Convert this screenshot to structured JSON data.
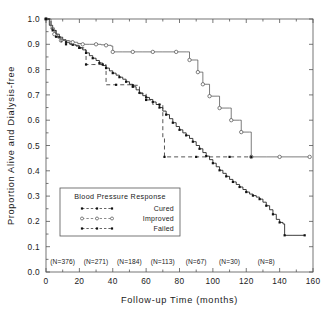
{
  "chart_data": {
    "type": "line",
    "title": "",
    "xlabel": "Follow-up Time (months)",
    "ylabel": "Proportion Alive and Dialysis-free",
    "xlim": [
      0,
      160
    ],
    "ylim": [
      0.0,
      1.0
    ],
    "xticks": [
      0,
      20,
      40,
      60,
      80,
      100,
      120,
      140,
      160
    ],
    "xticklabels": [
      "0",
      "20",
      "40",
      "60",
      "80",
      "100",
      "120",
      "140",
      "160"
    ],
    "yticks": [
      0.0,
      0.1,
      0.2,
      0.3,
      0.4,
      0.5,
      0.6,
      0.7,
      0.8,
      0.9,
      1.0
    ],
    "yticklabels": [
      "0.0",
      "0.1",
      "0.2",
      "0.3",
      "0.4",
      "0.5",
      "0.6",
      "0.7",
      "0.8",
      "0.9",
      "1.0"
    ],
    "grid": false,
    "legend_position": "lower-left",
    "legend_title": "Blood Pressure Response",
    "series": [
      {
        "name": "Cured",
        "marker": "filled-cross",
        "linestyle": "solid-censored",
        "points": [
          [
            0,
            1.0
          ],
          [
            2,
            0.975
          ],
          [
            4,
            0.955
          ],
          [
            6,
            0.94
          ],
          [
            8,
            0.928
          ],
          [
            10,
            0.918
          ],
          [
            12,
            0.908
          ],
          [
            14,
            0.902
          ],
          [
            16,
            0.898
          ],
          [
            18,
            0.893
          ],
          [
            20,
            0.886
          ],
          [
            22,
            0.878
          ],
          [
            24,
            0.866
          ],
          [
            26,
            0.855
          ],
          [
            28,
            0.845
          ],
          [
            30,
            0.836
          ],
          [
            32,
            0.826
          ],
          [
            34,
            0.816
          ],
          [
            36,
            0.806
          ],
          [
            38,
            0.795
          ],
          [
            40,
            0.786
          ],
          [
            42,
            0.778
          ],
          [
            44,
            0.77
          ],
          [
            46,
            0.762
          ],
          [
            48,
            0.752
          ],
          [
            50,
            0.742
          ],
          [
            52,
            0.732
          ],
          [
            54,
            0.72
          ],
          [
            56,
            0.708
          ],
          [
            58,
            0.697
          ],
          [
            60,
            0.69
          ],
          [
            62,
            0.682
          ],
          [
            64,
            0.672
          ],
          [
            66,
            0.662
          ],
          [
            68,
            0.65
          ],
          [
            70,
            0.636
          ],
          [
            72,
            0.622
          ],
          [
            74,
            0.606
          ],
          [
            76,
            0.59
          ],
          [
            78,
            0.575
          ],
          [
            80,
            0.562
          ],
          [
            82,
            0.55
          ],
          [
            84,
            0.54
          ],
          [
            86,
            0.528
          ],
          [
            88,
            0.515
          ],
          [
            90,
            0.5
          ],
          [
            92,
            0.487
          ],
          [
            94,
            0.472
          ],
          [
            96,
            0.458
          ],
          [
            98,
            0.444
          ],
          [
            100,
            0.43
          ],
          [
            102,
            0.416
          ],
          [
            104,
            0.402
          ],
          [
            106,
            0.39
          ],
          [
            108,
            0.378
          ],
          [
            110,
            0.366
          ],
          [
            112,
            0.356
          ],
          [
            114,
            0.346
          ],
          [
            116,
            0.336
          ],
          [
            118,
            0.326
          ],
          [
            120,
            0.316
          ],
          [
            122,
            0.308
          ],
          [
            124,
            0.302
          ],
          [
            126,
            0.296
          ],
          [
            128,
            0.288
          ],
          [
            130,
            0.276
          ],
          [
            132,
            0.262
          ],
          [
            134,
            0.246
          ],
          [
            136,
            0.228
          ],
          [
            138,
            0.208
          ],
          [
            140,
            0.196
          ],
          [
            142,
            0.19
          ],
          [
            143,
            0.145
          ],
          [
            148,
            0.145
          ],
          [
            155,
            0.145
          ]
        ]
      },
      {
        "name": "Improved",
        "marker": "open-circle",
        "linestyle": "solid-step",
        "points": [
          [
            0,
            1.0
          ],
          [
            3,
            0.965
          ],
          [
            5,
            0.94
          ],
          [
            7,
            0.925
          ],
          [
            9,
            0.915
          ],
          [
            14,
            0.912
          ],
          [
            16,
            0.908
          ],
          [
            19,
            0.903
          ],
          [
            22,
            0.9
          ],
          [
            26,
            0.9
          ],
          [
            30,
            0.9
          ],
          [
            33,
            0.898
          ],
          [
            36,
            0.896
          ],
          [
            39,
            0.893
          ],
          [
            40,
            0.87
          ],
          [
            46,
            0.87
          ],
          [
            52,
            0.87
          ],
          [
            58,
            0.87
          ],
          [
            64,
            0.87
          ],
          [
            70,
            0.87
          ],
          [
            78,
            0.87
          ],
          [
            84,
            0.87
          ],
          [
            86,
            0.838
          ],
          [
            90,
            0.838
          ],
          [
            91,
            0.79
          ],
          [
            93,
            0.79
          ],
          [
            94,
            0.742
          ],
          [
            97,
            0.742
          ],
          [
            98,
            0.695
          ],
          [
            103,
            0.695
          ],
          [
            104,
            0.648
          ],
          [
            110,
            0.648
          ],
          [
            111,
            0.6
          ],
          [
            116,
            0.6
          ],
          [
            117,
            0.553
          ],
          [
            122,
            0.553
          ],
          [
            123,
            0.455
          ],
          [
            132,
            0.455
          ],
          [
            140,
            0.455
          ],
          [
            148,
            0.455
          ],
          [
            158,
            0.455
          ]
        ]
      },
      {
        "name": "Failed",
        "marker": "filled-cross",
        "linestyle": "dashed",
        "points": [
          [
            0,
            1.0
          ],
          [
            3,
            0.96
          ],
          [
            6,
            0.93
          ],
          [
            9,
            0.91
          ],
          [
            12,
            0.9
          ],
          [
            16,
            0.896
          ],
          [
            20,
            0.886
          ],
          [
            23,
            0.878
          ],
          [
            24,
            0.82
          ],
          [
            28,
            0.82
          ],
          [
            34,
            0.82
          ],
          [
            36,
            0.74
          ],
          [
            42,
            0.74
          ],
          [
            48,
            0.74
          ],
          [
            52,
            0.738
          ],
          [
            56,
            0.705
          ],
          [
            60,
            0.68
          ],
          [
            64,
            0.662
          ],
          [
            68,
            0.662
          ],
          [
            70,
            0.53
          ],
          [
            71,
            0.455
          ],
          [
            80,
            0.455
          ],
          [
            90,
            0.455
          ],
          [
            100,
            0.455
          ],
          [
            110,
            0.455
          ],
          [
            120,
            0.455
          ],
          [
            123,
            0.455
          ]
        ]
      }
    ],
    "at_risk_labels": [
      {
        "text": "(N=376)",
        "x": 10
      },
      {
        "text": "(N=271)",
        "x": 30
      },
      {
        "text": "(N=184)",
        "x": 50
      },
      {
        "text": "(N=113)",
        "x": 70
      },
      {
        "text": "(N=67)",
        "x": 90
      },
      {
        "text": "(N=30)",
        "x": 110
      },
      {
        "text": "(N=8)",
        "x": 132
      }
    ]
  },
  "legend": {
    "title": "Blood Pressure Response",
    "items": [
      {
        "label": "Cured",
        "marker": "filled-cross"
      },
      {
        "label": "Improved",
        "marker": "open-circle"
      },
      {
        "label": "Failed",
        "marker": "filled-cross"
      }
    ]
  },
  "colors": {
    "cured": "#1b1b1b",
    "improved": "#5a5a5a",
    "failed": "#2a2a2a",
    "axis": "#555555",
    "background": "#ffffff"
  }
}
